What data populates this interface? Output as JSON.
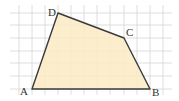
{
  "figure": {
    "type": "quadrilateral-on-grid",
    "colors": {
      "background": "#ffffff",
      "grid": "#d6d6d6",
      "fill": "#fbeac4",
      "edge": "#3a3a3a",
      "label": "#333333"
    },
    "grid": {
      "x_lines": [
        19,
        32,
        45,
        58,
        71,
        84,
        97,
        110,
        124,
        137,
        150,
        163
      ],
      "y_lines": [
        13,
        25,
        38,
        51,
        63,
        76,
        89
      ],
      "x_min": 10,
      "x_max": 172,
      "y_min": 5,
      "y_max": 95
    },
    "vertices": [
      {
        "name": "A",
        "x": 32,
        "y": 89
      },
      {
        "name": "B",
        "x": 150,
        "y": 89
      },
      {
        "name": "C",
        "x": 124,
        "y": 38
      },
      {
        "name": "D",
        "x": 58,
        "y": 13
      }
    ],
    "labels": {
      "A": "A",
      "B": "B",
      "C": "C",
      "D": "D"
    }
  }
}
